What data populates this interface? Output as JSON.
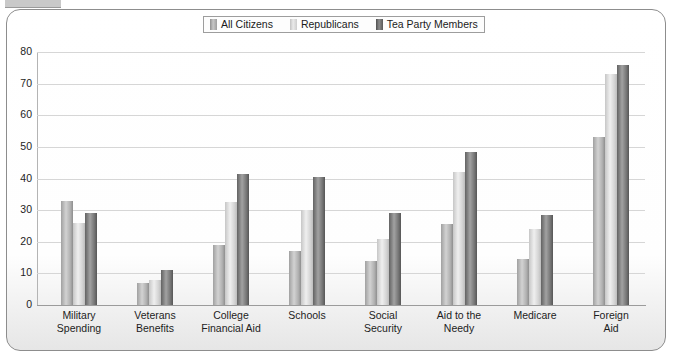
{
  "chart_data": {
    "type": "bar",
    "title": "",
    "xlabel": "",
    "ylabel": "",
    "ylim": [
      0,
      80
    ],
    "yticks": [
      0,
      10,
      20,
      30,
      40,
      50,
      60,
      70,
      80
    ],
    "grid": true,
    "legend_position": "top-center",
    "categories": [
      "Military Spending",
      "Veterans Benefits",
      "College Financial Aid",
      "Schools",
      "Social Security",
      "Aid to the Needy",
      "Medicare",
      "Foreign Aid"
    ],
    "category_lines": [
      [
        "Military",
        "Spending"
      ],
      [
        "Veterans",
        "Benefits"
      ],
      [
        "College",
        "Financial Aid"
      ],
      [
        "Schools",
        ""
      ],
      [
        "Social",
        "Security"
      ],
      [
        "Aid to the",
        "Needy"
      ],
      [
        "Medicare",
        ""
      ],
      [
        "Foreign",
        "Aid"
      ]
    ],
    "series": [
      {
        "name": "All Citizens",
        "color": "#b6b6b6",
        "values": [
          33,
          7,
          19,
          17,
          14,
          25.5,
          14.5,
          53
        ]
      },
      {
        "name": "Republicans",
        "color": "#e0e0e0",
        "values": [
          26,
          8,
          32.5,
          30,
          21,
          42,
          24,
          73
        ]
      },
      {
        "name": "Tea Party Members",
        "color": "#7a7a7a",
        "values": [
          29,
          11,
          41.5,
          40.5,
          29,
          48.5,
          28.5,
          76
        ]
      }
    ]
  },
  "legend": {
    "items": [
      {
        "label": "All Citizens"
      },
      {
        "label": "Republicans"
      },
      {
        "label": "Tea Party Members"
      }
    ]
  },
  "axis": {
    "y_tick_labels": [
      "80",
      "70",
      "60",
      "50",
      "40",
      "30",
      "20",
      "10",
      "0"
    ]
  }
}
